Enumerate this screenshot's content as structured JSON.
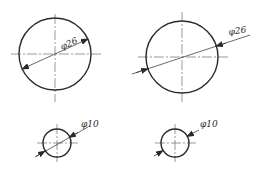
{
  "figure": {
    "views": [
      {
        "id": "top-left",
        "diameter_label": "φ26",
        "style": "dimension line through center, arrows inside circle",
        "center": [
          55,
          54
        ],
        "radius": 36
      },
      {
        "id": "top-right",
        "diameter_label": "φ26",
        "style": "leader extended outside, arrows inside pointing outward to edge",
        "center": [
          182,
          57
        ],
        "radius": 36
      },
      {
        "id": "bottom-left",
        "diameter_label": "φ10",
        "style": "small circle, line through center, arrows on edge",
        "center": [
          57,
          143
        ],
        "radius": 14
      },
      {
        "id": "bottom-right",
        "diameter_label": "φ10",
        "style": "small circle, arrows outside pointing inward",
        "center": [
          175,
          143
        ],
        "radius": 14
      }
    ],
    "colors": {
      "line": "#2a2a2a",
      "centerline": "#555555",
      "background": "#ffffff"
    }
  }
}
